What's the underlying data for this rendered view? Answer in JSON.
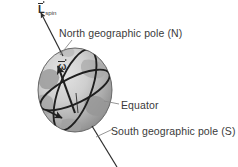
{
  "figure": {
    "type": "physics-diagram",
    "background_color": "#ffffff"
  },
  "labels": {
    "spin_vector": {
      "symbol": "L",
      "subscript": "spin",
      "has_vector_arrow": true,
      "full_text": "L_spin"
    },
    "angular_velocity": {
      "symbol": "ω",
      "has_vector_arrow": true,
      "full_text": "ω"
    },
    "north_pole": "North geographic pole  (N)",
    "equator": "Equator",
    "south_pole": "South geographic pole  (S)"
  },
  "colors": {
    "text": "#3a3a3a",
    "line": "#2e2e2e",
    "leader_line": "#8a8a8a",
    "globe_light": "#d8d8d8",
    "globe_mid": "#b4b4b4",
    "globe_dark": "#8f8f8f",
    "continent": "#9a9a9a",
    "outline": "#1f1f1f"
  },
  "geometry": {
    "globe": {
      "cx": 75,
      "cy": 90,
      "rx": 37,
      "ry": 42
    },
    "axis": {
      "top_point": [
        40,
        12
      ],
      "north_pole_point": [
        62,
        55
      ],
      "south_pole_point": [
        92,
        128
      ],
      "bottom_point": [
        116,
        167
      ]
    },
    "omega_arrow": {
      "from": [
        74,
        112
      ],
      "to": [
        57,
        64
      ]
    }
  }
}
